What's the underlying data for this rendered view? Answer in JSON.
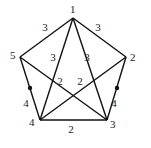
{
  "graph": {
    "vertices": [
      {
        "id": "1",
        "label": "1",
        "x": 73,
        "y": 18,
        "lx": 70,
        "ly": 13
      },
      {
        "id": "2",
        "label": "2",
        "x": 126,
        "y": 57,
        "lx": 130,
        "ly": 61
      },
      {
        "id": "3",
        "label": "3",
        "x": 107,
        "y": 120,
        "lx": 110,
        "ly": 128
      },
      {
        "id": "4",
        "label": "4",
        "x": 40,
        "y": 120,
        "lx": 29,
        "ly": 126
      },
      {
        "id": "5",
        "label": "5",
        "x": 20,
        "y": 57,
        "lx": 10,
        "ly": 59
      }
    ],
    "edges": [
      {
        "from": "1",
        "to": "5",
        "weight": "3",
        "lx": 45,
        "ly": 31
      },
      {
        "from": "1",
        "to": "2",
        "weight": "3",
        "lx": 98,
        "ly": 31
      },
      {
        "from": "1",
        "to": "4",
        "weight": "3",
        "lx": 53,
        "ly": 61
      },
      {
        "from": "1",
        "to": "3",
        "weight": "3",
        "lx": 87,
        "ly": 61
      },
      {
        "from": "5",
        "to": "3",
        "weight": "2",
        "lx": 60,
        "ly": 85
      },
      {
        "from": "2",
        "to": "4",
        "weight": "2",
        "lx": 80,
        "ly": 85
      },
      {
        "from": "5",
        "to": "4",
        "weight": "4",
        "lx": 26,
        "ly": 107
      },
      {
        "from": "2",
        "to": "3",
        "weight": "4",
        "lx": 114,
        "ly": 107
      },
      {
        "from": "4",
        "to": "3",
        "weight": "2",
        "lx": 71,
        "ly": 133
      }
    ],
    "markers": [
      {
        "x": 30,
        "y": 88
      },
      {
        "x": 117,
        "y": 88
      }
    ]
  }
}
